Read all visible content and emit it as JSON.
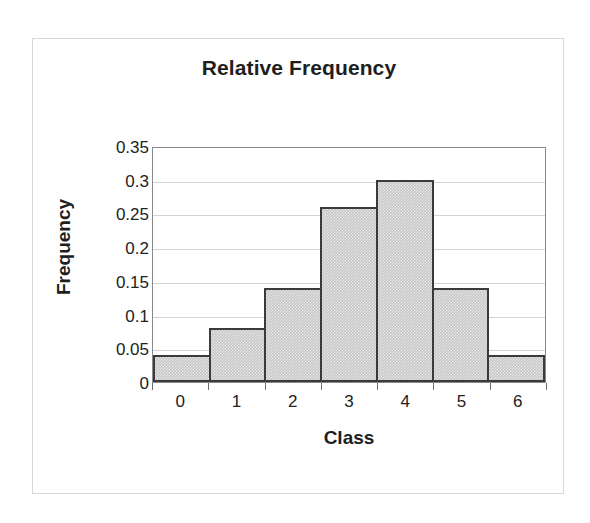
{
  "chart_data": {
    "type": "bar",
    "title": "Relative Frequency",
    "xlabel": "Class",
    "ylabel": "Frequency",
    "categories": [
      "0",
      "1",
      "2",
      "3",
      "4",
      "5",
      "6"
    ],
    "values": [
      0.04,
      0.08,
      0.14,
      0.26,
      0.3,
      0.14,
      0.04
    ],
    "ylim": [
      0,
      0.35
    ],
    "yticks": [
      "0",
      "0.05",
      "0.1",
      "0.15",
      "0.2",
      "0.25",
      "0.3",
      "0.35"
    ],
    "ytick_values": [
      0,
      0.05,
      0.1,
      0.15,
      0.2,
      0.25,
      0.3,
      0.35
    ],
    "grid": true,
    "legend": false,
    "bar_gap": 0,
    "colors": {
      "bar_fill": "#c6c6c6",
      "bar_border": "#3a3a3a",
      "gridline": "#d4d4d4",
      "axis": "#8a8a8a",
      "text": "#1e1e1e",
      "frame": "#d8d8d8",
      "background": "#ffffff"
    }
  }
}
